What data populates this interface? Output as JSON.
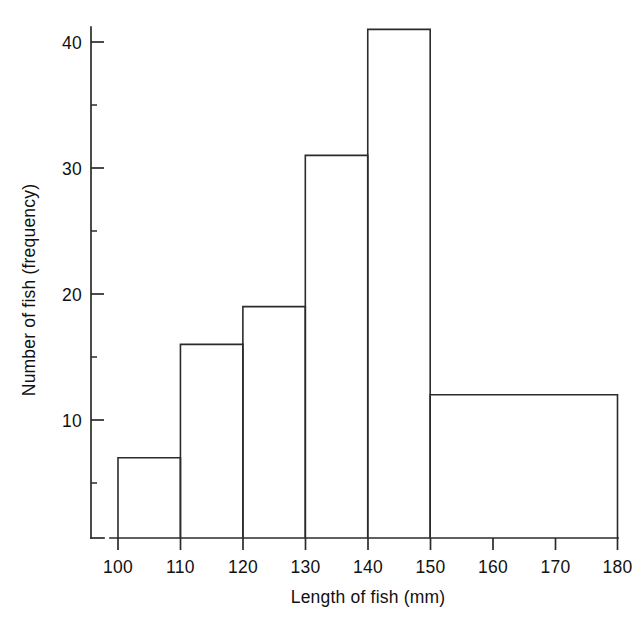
{
  "chart_data": {
    "type": "bar",
    "title": "",
    "xlabel": "Length of fish (mm)",
    "ylabel": "Number of fish (frequency)",
    "categories": [
      "100-110",
      "110-120",
      "120-130",
      "130-140",
      "140-150",
      "150-180"
    ],
    "bin_edges": [
      100,
      110,
      120,
      130,
      140,
      150,
      180
    ],
    "values": [
      7,
      16,
      19,
      31,
      41,
      12
    ],
    "xlim": [
      100,
      180
    ],
    "ylim": [
      0,
      41
    ],
    "x_ticks": [
      100,
      110,
      120,
      130,
      140,
      150,
      160,
      170,
      180
    ],
    "x_tick_labels": [
      "100",
      "110",
      "120",
      "130",
      "140",
      "150",
      "160",
      "170",
      "180"
    ],
    "y_ticks": [
      10,
      20,
      30,
      40
    ],
    "y_tick_labels": [
      "10",
      "20",
      "30",
      "40"
    ],
    "y_minor_ticks": [
      5,
      15,
      25,
      35
    ],
    "grid": false,
    "legend": false,
    "bar_fill": "#ffffff",
    "bar_stroke": "#2b2b2b",
    "axis_color": "#2b2b2b"
  },
  "axes": {
    "y_title": "Number of fish (frequency)",
    "x_title": "Length of fish (mm)",
    "y_labels": {
      "t10": "10",
      "t20": "20",
      "t30": "30",
      "t40": "40"
    },
    "x_labels": {
      "t100": "100",
      "t110": "110",
      "t120": "120",
      "t130": "130",
      "t140": "140",
      "t150": "150",
      "t160": "160",
      "t170": "170",
      "t180": "180"
    }
  }
}
